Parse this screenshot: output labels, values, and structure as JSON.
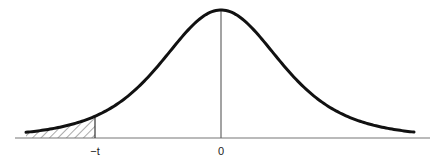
{
  "figure": {
    "type": "normal-distribution-curve",
    "curve_color": "#111111",
    "axis_color": "#777777",
    "hatch_color": "#555555",
    "labels": {
      "neg_t": "−t",
      "zero": "0"
    },
    "shaded_region": "left tail (x < -t)"
  },
  "chart_data": {
    "type": "line",
    "title": "",
    "xlabel": "",
    "ylabel": "",
    "tick_labels": [
      "−t",
      "0"
    ],
    "annotations": [
      "shaded left-tail area below −t",
      "vertical line at mean 0"
    ],
    "grid": false,
    "legend": null
  }
}
